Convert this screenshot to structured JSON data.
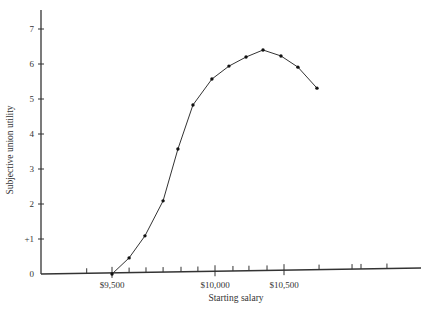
{
  "chart_data": {
    "type": "line",
    "title": "",
    "xlabel": "Starting salary",
    "ylabel": "Subjective union utility",
    "ylim": [
      0,
      7.5
    ],
    "xlim": [
      9200,
      11500
    ],
    "grid": false,
    "legend": "none",
    "y_ticks": [
      {
        "value": 0,
        "label": "0"
      },
      {
        "value": 1,
        "label": "+1"
      },
      {
        "value": 2,
        "label": "2"
      },
      {
        "value": 3,
        "label": "3"
      },
      {
        "value": 4,
        "label": "4"
      },
      {
        "value": 5,
        "label": "5"
      },
      {
        "value": 6,
        "label": "6"
      },
      {
        "value": 7,
        "label": "7"
      }
    ],
    "x_labeled_ticks": [
      {
        "value": 9500,
        "label": "$9,500"
      },
      {
        "value": 10000,
        "label": "$10,000"
      },
      {
        "value": 10500,
        "label": "$10,500"
      }
    ],
    "x_minor_ticks": [
      9335,
      9583,
      9665,
      9748,
      9835,
      9917,
      10130,
      10246,
      10377,
      10754,
      10993,
      11058,
      11246
    ],
    "series": [
      {
        "name": "utility",
        "x": [
          9500,
          9583,
          9660,
          9748,
          9820,
          9893,
          9985,
          10101,
          10225,
          10348,
          10478,
          10601,
          10739
        ],
        "y": [
          0,
          0.46,
          1.09,
          2.09,
          3.57,
          4.83,
          5.57,
          5.94,
          6.2,
          6.4,
          6.23,
          5.91,
          5.31
        ]
      }
    ]
  }
}
